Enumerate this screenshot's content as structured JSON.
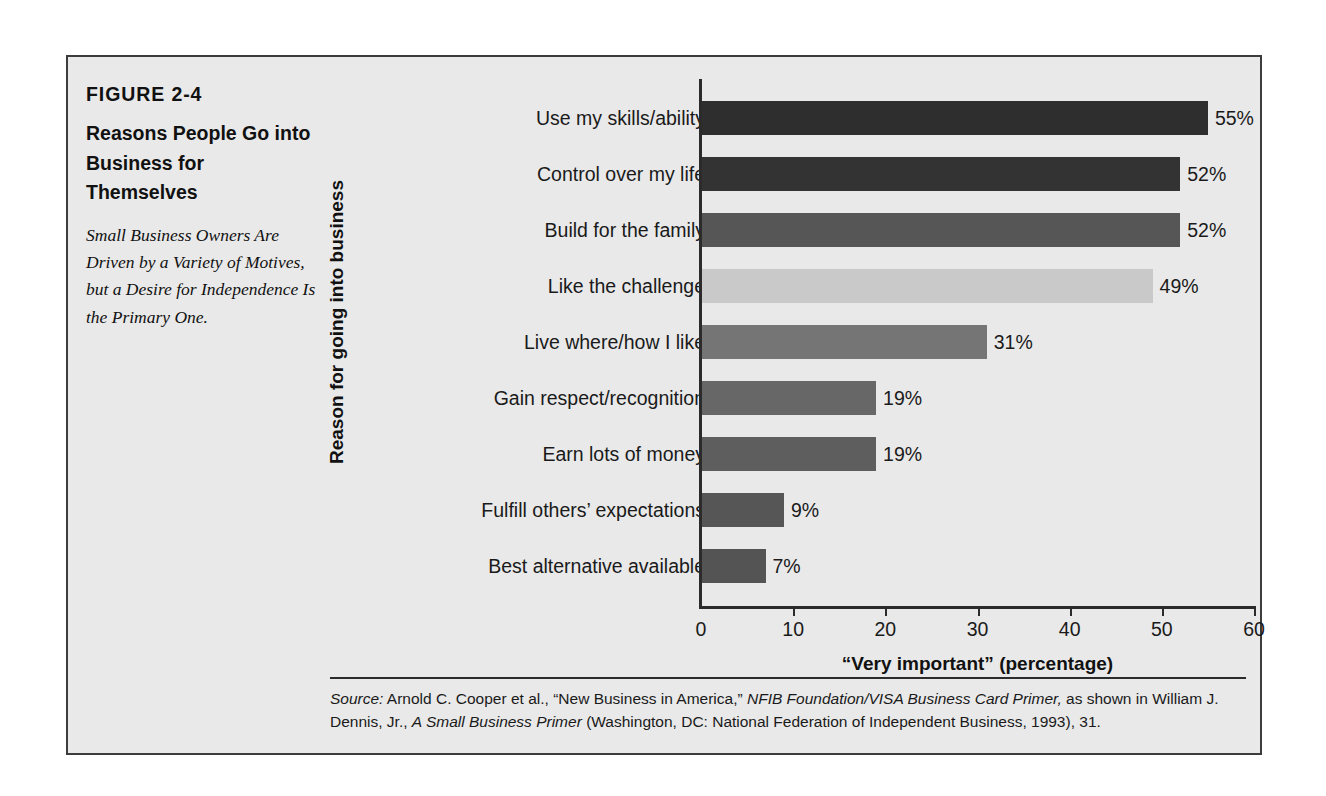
{
  "figure": {
    "number": "FIGURE 2-4",
    "title": "Reasons People Go into Business for Themselves",
    "subtitle": "Small Business Owners Are Driven by a Variety of Motives, but a Desire for Independence Is the Primary One.",
    "source_prefix": "Source:",
    "source_text_1": " Arnold C. Cooper et al., “New Business in America,” ",
    "source_italic_1": "NFIB Foundation/VISA Business Card Primer,",
    "source_text_2": " as shown in William J. Dennis, Jr., ",
    "source_italic_2": "A Small Business Primer",
    "source_text_3": " (Washington, DC: National Federation of Independent Business,  1993), 31."
  },
  "chart_data": {
    "type": "bar",
    "orientation": "horizontal",
    "title": "Reasons People Go into Business for Themselves",
    "xlabel": "“Very important” (percentage)",
    "ylabel": "Reason for going into business",
    "xlim": [
      0,
      60
    ],
    "xticks": [
      0,
      10,
      20,
      30,
      40,
      50,
      60
    ],
    "xtick_labels": [
      "0",
      "10",
      "20",
      "30",
      "40",
      "50",
      "60"
    ],
    "grid": false,
    "legend": false,
    "categories": [
      "Use my skills/ability",
      "Control over my life",
      "Build for the family",
      "Like the challenge",
      "Live where/how I like",
      "Gain respect/recognition",
      "Earn lots of money",
      "Fulfill others’ expectations",
      "Best alternative available"
    ],
    "values": [
      55,
      52,
      52,
      49,
      31,
      19,
      19,
      9,
      7
    ],
    "value_labels": [
      "55%",
      "52%",
      "52%",
      "49%",
      "31%",
      "19%",
      "19%",
      "9%",
      "7%"
    ],
    "bar_colors": [
      "#2e2e2e",
      "#333333",
      "#565656",
      "#c9c9c9",
      "#757575",
      "#676767",
      "#5e5e5e",
      "#565656",
      "#545454"
    ]
  },
  "colors": {
    "panel_background": "#e9e9e9",
    "page_background": "#ffffff",
    "frame": "#3c3c3c",
    "axis": "#2b2b2b",
    "text": "#1a1a1a"
  }
}
